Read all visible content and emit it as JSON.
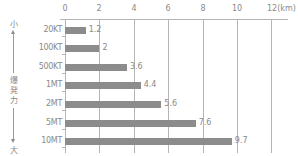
{
  "chart_data": {
    "type": "bar",
    "orientation": "horizontal",
    "title": "",
    "xlabel": "",
    "unit_label": "(km)",
    "ylabel": "爆発力",
    "ylabel_top": "小",
    "ylabel_bottom": "大",
    "xlim": [
      0,
      12
    ],
    "x_ticks": [
      "0",
      "2",
      "4",
      "6",
      "8",
      "10",
      "12"
    ],
    "grid": true,
    "categories": [
      "20KT",
      "100KT",
      "500KT",
      "1MT",
      "2MT",
      "5MT",
      "10MT"
    ],
    "values": [
      1.2,
      2,
      3.6,
      4.4,
      5.6,
      7.6,
      9.7
    ],
    "value_labels": [
      "1.2",
      "2",
      "3.6",
      "4.4",
      "5.6",
      "7.6",
      "9.7"
    ],
    "bar_color": "#8c8c8c",
    "grid_color": "#b5b5b5",
    "text_color": "#8a8a8a"
  }
}
